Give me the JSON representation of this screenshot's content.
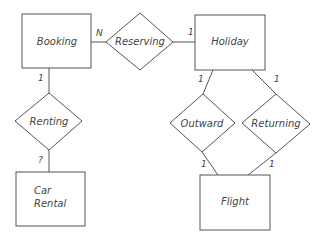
{
  "diagram": {
    "type": "entity-relationship",
    "entities": [
      {
        "id": "booking",
        "label": "Booking"
      },
      {
        "id": "holiday",
        "label": "Holiday"
      },
      {
        "id": "car_rental",
        "label_line1": "Car",
        "label_line2": "Rental"
      },
      {
        "id": "flight",
        "label": "Flight"
      }
    ],
    "relationships": [
      {
        "id": "reserving",
        "label": "Reserving"
      },
      {
        "id": "renting",
        "label": "Renting"
      },
      {
        "id": "outward",
        "label": "Outward"
      },
      {
        "id": "returning",
        "label": "Returning"
      }
    ],
    "cardinalities": {
      "booking_reserving": "N",
      "holiday_reserving": "1",
      "booking_renting": "1",
      "carrental_renting": "?",
      "holiday_outward": "1",
      "holiday_returning": "1",
      "flight_outward": "1",
      "flight_returning": "1"
    },
    "colors": {
      "stroke": "#555555",
      "text": "#444444",
      "background": "#ffffff"
    }
  }
}
